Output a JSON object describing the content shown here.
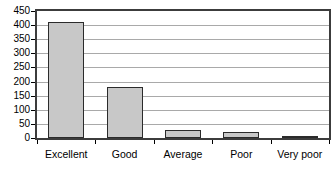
{
  "chart_data": {
    "type": "bar",
    "title": "",
    "subtitle": "",
    "xlabel": "",
    "ylabel": "",
    "categories": [
      "Excellent",
      "Good",
      "Average",
      "Poor",
      "Very poor"
    ],
    "values": [
      410,
      180,
      28,
      20,
      2
    ],
    "ylim": [
      0,
      450
    ],
    "ytick_values": [
      0,
      50,
      100,
      150,
      200,
      250,
      300,
      350,
      400,
      450
    ],
    "ytick_labels": [
      "0",
      "50",
      "100",
      "150",
      "200",
      "250",
      "300",
      "350",
      "400",
      "450"
    ],
    "grid": true,
    "grid_axis": "y",
    "legend": false,
    "legend_position": "none",
    "bar_fill_color": "#c8c8c8",
    "bar_border_color": "#2b2b2b",
    "plot_border_color": "#3c3c3c",
    "gridline_color": "#a9a9a9",
    "background_color": "#ffffff",
    "text_color": "#000000"
  }
}
